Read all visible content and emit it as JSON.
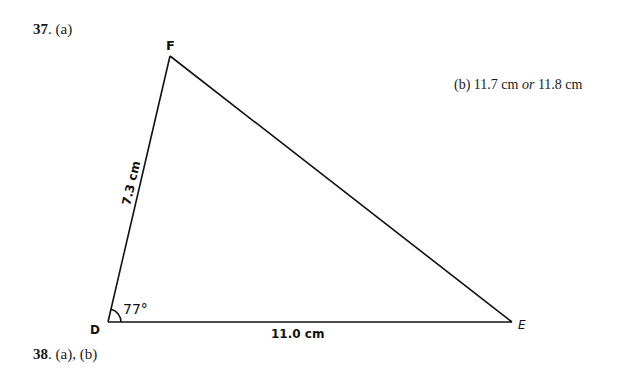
{
  "question_37": {
    "number": "37",
    "part_a_label": ". (a)",
    "part_b": {
      "label": "(b)",
      "value1": "11.7 cm",
      "connector": "or",
      "value2": "11.8 cm"
    }
  },
  "question_38": {
    "number": "38",
    "parts_label": ". (a), (b)"
  },
  "triangle": {
    "vertices": {
      "D": {
        "label": "D",
        "x": 108,
        "y": 322
      },
      "F": {
        "label": "F",
        "x": 170,
        "y": 56
      },
      "E": {
        "label": "E",
        "x": 512,
        "y": 322
      }
    },
    "side_DF": "7.3 cm",
    "side_DE": "11.0 cm",
    "angle_D": "77°",
    "stroke_color": "#111111"
  }
}
